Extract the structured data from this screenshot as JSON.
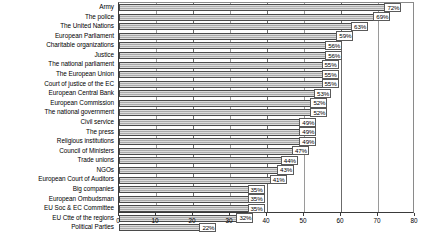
{
  "chart_data": {
    "type": "bar",
    "orientation": "horizontal",
    "title": "",
    "subtitle": "",
    "xlabel": "",
    "ylabel": "",
    "xlim": [
      0,
      80
    ],
    "xticks": [
      0,
      10,
      20,
      30,
      40,
      50,
      60,
      70,
      80
    ],
    "xtick_labels": [
      "0",
      "10",
      "20",
      "30",
      "40",
      "50",
      "60",
      "70",
      "80"
    ],
    "grid": true,
    "grid_axis": "x",
    "legend": false,
    "value_label_suffix": "%",
    "bar_color": "#b3b3b3",
    "bar_edge_color": "#4a4a4a",
    "categories": [
      "Army",
      "The police",
      "The United Nations",
      "European Parliament",
      "Charitable organizations",
      "Justice",
      "The national parliament",
      "The European Union",
      "Court of justice of the EC",
      "European Central Bank",
      "European Commission",
      "The national government",
      "Civil service",
      "The press",
      "Religious institutions",
      "Council of Ministers",
      "Trade unions",
      "NGOs",
      "European Court of Auditors",
      "Big companies",
      "European Ombudsman",
      "EU Soc & EC Committee",
      "EU Ctte of the regions",
      "Political Parties"
    ],
    "values": [
      72,
      69,
      63,
      59,
      56,
      56,
      55,
      55,
      55,
      53,
      52,
      52,
      49,
      49,
      49,
      47,
      44,
      43,
      41,
      35,
      35,
      35,
      32,
      22
    ],
    "value_labels": [
      "72%",
      "69%",
      "63%",
      "59%",
      "56%",
      "56%",
      "55%",
      "55%",
      "55%",
      "53%",
      "52%",
      "52%",
      "49%",
      "49%",
      "49%",
      "47%",
      "44%",
      "43%",
      "41%",
      "35%",
      "35%",
      "35%",
      "32%",
      "22%"
    ]
  }
}
